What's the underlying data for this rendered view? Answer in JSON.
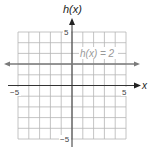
{
  "chart_data": {
    "type": "line",
    "title": "",
    "xlabel": "x",
    "ylabel": "h(x)",
    "xlim": [
      -5,
      5
    ],
    "ylim": [
      -5,
      5
    ],
    "grid": true,
    "x_ticks_labeled": [
      -5,
      5
    ],
    "y_ticks_labeled": [
      5,
      -5
    ],
    "series": [
      {
        "name": "h(x) = 2",
        "function": "h(x) = 2",
        "x": [
          -6,
          -5,
          -4,
          -3,
          -2,
          -1,
          0,
          1,
          2,
          3,
          4,
          5,
          6
        ],
        "values": [
          2,
          2,
          2,
          2,
          2,
          2,
          2,
          2,
          2,
          2,
          2,
          2,
          2
        ],
        "color": "#777777",
        "arrows": "both"
      }
    ],
    "annotations": [
      {
        "text": "h(x) = 2",
        "x": 2.8,
        "y": 2.9
      }
    ]
  },
  "labels": {
    "y_axis": "h(x)",
    "x_axis": "x",
    "x_min": "−5",
    "x_max": "5",
    "y_max": "5",
    "y_min": "−5",
    "line_label": "h(x) = 2"
  },
  "colors": {
    "grid": "#b5b5b5",
    "axis": "#333333",
    "line": "#7a7a7a",
    "label_gray": "#999999"
  }
}
